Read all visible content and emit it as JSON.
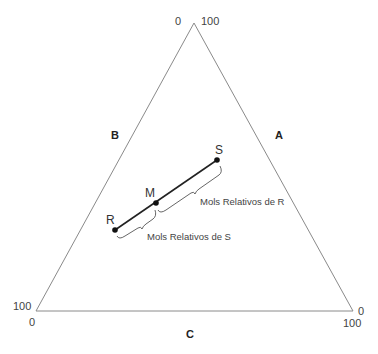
{
  "diagram": {
    "type": "ternary-lever-rule",
    "triangle": {
      "apex_labels": {
        "left": "0",
        "right": "100"
      },
      "bottom_left_labels": {
        "left": "100",
        "below": "0"
      },
      "bottom_right_labels": {
        "right": "0",
        "below": "100"
      },
      "side_labels": {
        "left": "B",
        "right": "A",
        "bottom": "C"
      }
    },
    "points": [
      {
        "id": "R",
        "label": "R"
      },
      {
        "id": "M",
        "label": "M"
      },
      {
        "id": "S",
        "label": "S"
      }
    ],
    "annotations": {
      "upper_brace": "Mols Relativos de R",
      "lower_brace": "Mols Relativos de S"
    },
    "colors": {
      "line": "#222222",
      "triangle": "#888888",
      "brace": "#555555"
    }
  }
}
